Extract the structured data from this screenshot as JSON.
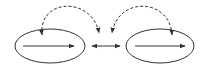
{
  "diagram": {
    "stroke_color": "#333333",
    "background": "#ffffff",
    "nodes": [
      {
        "id": "left-ellipse",
        "cx": 50,
        "cy": 46,
        "rx": 35,
        "ry": 17
      },
      {
        "id": "right-ellipse",
        "cx": 160,
        "cy": 46,
        "rx": 34,
        "ry": 17
      }
    ],
    "internal_arrows": [
      {
        "id": "left-inner-arrow",
        "x1": 23,
        "y1": 46,
        "x2": 74,
        "y2": 46
      },
      {
        "id": "right-inner-arrow",
        "x1": 135,
        "y1": 46,
        "x2": 185,
        "y2": 46
      }
    ],
    "center_arrow": {
      "x1": 92,
      "x2": 120,
      "y": 46,
      "bidirectional": true
    },
    "dashed_arcs": [
      {
        "id": "left-dashed-arc",
        "path": "M 42 35 C 38 -2, 92 -4, 99 33"
      },
      {
        "id": "right-dashed-arc",
        "path": "M 172 35 C 170 -2, 118 -4, 112 33"
      }
    ]
  }
}
